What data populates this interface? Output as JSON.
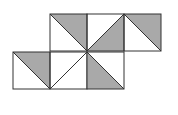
{
  "diagram": {
    "colors": {
      "fill": "#a9a9a9",
      "stroke": "#333333",
      "background": "#ffffff"
    },
    "cells": [
      {
        "id": "top-1",
        "row": "top",
        "x": 50,
        "y": 14,
        "diagonal": "tl-br",
        "shaded": "upper-right"
      },
      {
        "id": "top-2",
        "row": "top",
        "x": 87,
        "y": 14,
        "diagonal": "bl-tr",
        "shaded": "lower-right"
      },
      {
        "id": "top-3",
        "row": "top",
        "x": 124,
        "y": 14,
        "diagonal": "tl-br",
        "shaded": "upper-right"
      },
      {
        "id": "bottom-1",
        "row": "bottom",
        "x": 13,
        "y": 52,
        "diagonal": "tl-br",
        "shaded": "upper-right"
      },
      {
        "id": "bottom-2",
        "row": "bottom",
        "x": 50,
        "y": 52,
        "diagonal": "bl-tr",
        "shaded": "none"
      },
      {
        "id": "bottom-3",
        "row": "bottom",
        "x": 87,
        "y": 52,
        "diagonal": "tl-br",
        "shaded": "lower-left"
      }
    ],
    "cell_size": 37
  }
}
